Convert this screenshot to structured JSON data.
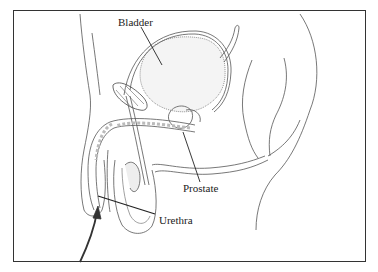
{
  "diagram": {
    "type": "anatomical illustration",
    "labels": [
      {
        "id": "bladder",
        "text": "Bladder"
      },
      {
        "id": "prostate",
        "text": "Prostate"
      },
      {
        "id": "urethra",
        "text": "Urethra"
      }
    ],
    "annotations": [
      {
        "id": "arrow",
        "description": "curved arrow pointing up into urethral opening"
      }
    ]
  },
  "colors": {
    "line": "#444444",
    "frame": "#333333",
    "shade": "#bbbbbb",
    "background": "#ffffff"
  }
}
